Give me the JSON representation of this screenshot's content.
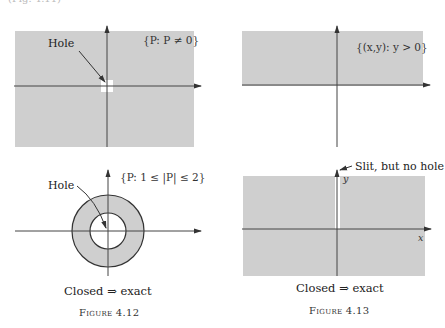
{
  "page": {
    "top_cut_text": "(Fig. 4.11)",
    "colors": {
      "region_fill": "#cfcfcf",
      "axis": "#333333",
      "background": "#ffffff"
    }
  },
  "fig_4_11_top_left": {
    "set_label": "{P: P ≠ 0}",
    "hole_label": "Hole"
  },
  "fig_4_11_top_right": {
    "set_label": "{(x,y): y > 0}"
  },
  "figure_4_12": {
    "set_label": "{P: 1 ≤ |P| ≤ 2}",
    "hole_label": "Hole",
    "caption": "Closed  ⇒  exact",
    "figure_label": "Figure 4.12"
  },
  "figure_4_13": {
    "slit_label": "Slit, but no hole",
    "y_axis_label": "y",
    "x_axis_label": "x",
    "caption": "Closed  ⇒  exact",
    "figure_label": "Figure 4.13"
  }
}
